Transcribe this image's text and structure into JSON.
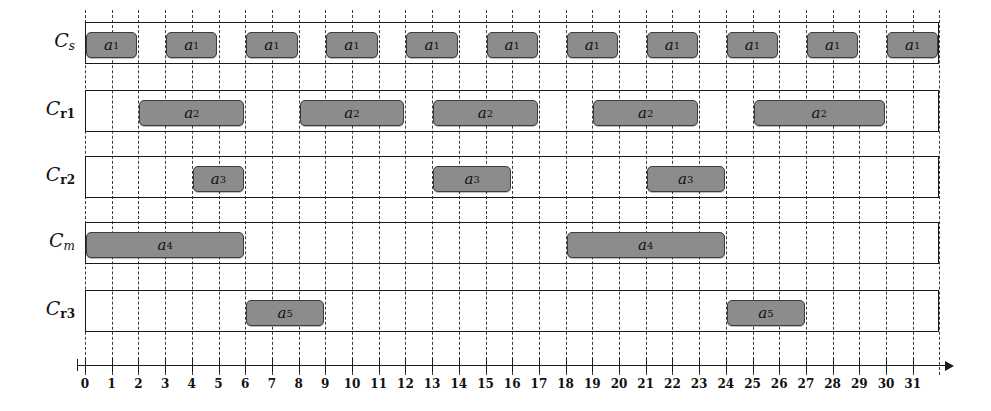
{
  "figure": {
    "kind": "gantt-schedule",
    "bar_fill": "#8c8c8c",
    "bar_stroke": "#3c3c3c",
    "line_color": "#1a1a1a",
    "grid_color": "#3a3a3a",
    "background": "#ffffff"
  },
  "axis": {
    "ticks": [
      "0",
      "1",
      "2",
      "3",
      "4",
      "5",
      "6",
      "7",
      "8",
      "9",
      "10",
      "11",
      "12",
      "13",
      "14",
      "15",
      "16",
      "17",
      "18",
      "19",
      "20",
      "21",
      "22",
      "23",
      "24",
      "25",
      "26",
      "27",
      "28",
      "29",
      "30",
      "31"
    ],
    "min": 0,
    "max": 32,
    "tick_step": 1,
    "label": ""
  },
  "rows": [
    {
      "id": "cs",
      "label_main": "C",
      "label_sub": "s",
      "label_sub_italic": true,
      "lane_start": 0,
      "lane_end": 32,
      "tasks": [
        {
          "name": "a",
          "sub": "1",
          "start": 0,
          "end": 2
        },
        {
          "name": "a",
          "sub": "1",
          "start": 3,
          "end": 5
        },
        {
          "name": "a",
          "sub": "1",
          "start": 6,
          "end": 8
        },
        {
          "name": "a",
          "sub": "1",
          "start": 9,
          "end": 11
        },
        {
          "name": "a",
          "sub": "1",
          "start": 12,
          "end": 14
        },
        {
          "name": "a",
          "sub": "1",
          "start": 15,
          "end": 17
        },
        {
          "name": "a",
          "sub": "1",
          "start": 18,
          "end": 20
        },
        {
          "name": "a",
          "sub": "1",
          "start": 21,
          "end": 23
        },
        {
          "name": "a",
          "sub": "1",
          "start": 24,
          "end": 26
        },
        {
          "name": "a",
          "sub": "1",
          "start": 27,
          "end": 29
        },
        {
          "name": "a",
          "sub": "1",
          "start": 30,
          "end": 32
        }
      ]
    },
    {
      "id": "cr1",
      "label_main": "C",
      "label_sub": "r1",
      "label_sub_italic": false,
      "lane_start": 0,
      "lane_end": 32,
      "tasks": [
        {
          "name": "a",
          "sub": "2",
          "start": 2,
          "end": 6
        },
        {
          "name": "a",
          "sub": "2",
          "start": 8,
          "end": 12
        },
        {
          "name": "a",
          "sub": "2",
          "start": 13,
          "end": 17
        },
        {
          "name": "a",
          "sub": "2",
          "start": 19,
          "end": 23
        },
        {
          "name": "a",
          "sub": "2",
          "start": 25,
          "end": 30
        }
      ]
    },
    {
      "id": "cr2",
      "label_main": "C",
      "label_sub": "r2",
      "label_sub_italic": false,
      "lane_start": 0,
      "lane_end": 32,
      "tasks": [
        {
          "name": "a",
          "sub": "3",
          "start": 4,
          "end": 6
        },
        {
          "name": "a",
          "sub": "3",
          "start": 13,
          "end": 16
        },
        {
          "name": "a",
          "sub": "3",
          "start": 21,
          "end": 24
        }
      ]
    },
    {
      "id": "cm",
      "label_main": "C",
      "label_sub": "m",
      "label_sub_italic": true,
      "lane_start": 0,
      "lane_end": 32,
      "tasks": [
        {
          "name": "a",
          "sub": "4",
          "start": 0,
          "end": 6
        },
        {
          "name": "a",
          "sub": "4",
          "start": 18,
          "end": 24
        }
      ]
    },
    {
      "id": "cr3",
      "label_main": "C",
      "label_sub": "r3",
      "label_sub_italic": false,
      "lane_start": 0,
      "lane_end": 32,
      "tasks": [
        {
          "name": "a",
          "sub": "5",
          "start": 6,
          "end": 9
        },
        {
          "name": "a",
          "sub": "5",
          "start": 24,
          "end": 27
        }
      ]
    }
  ],
  "chart_data": {
    "type": "bar",
    "title": "",
    "xlabel": "",
    "ylabel": "",
    "xlim": [
      0,
      32
    ],
    "grid": true,
    "legend": "none",
    "categories": [
      "C_s",
      "C_r1",
      "C_r2",
      "C_m",
      "C_r3"
    ],
    "series": [
      {
        "name": "a_1",
        "row": "C_s",
        "intervals": [
          [
            0,
            2
          ],
          [
            3,
            5
          ],
          [
            6,
            8
          ],
          [
            9,
            11
          ],
          [
            12,
            14
          ],
          [
            15,
            17
          ],
          [
            18,
            20
          ],
          [
            21,
            23
          ],
          [
            24,
            26
          ],
          [
            27,
            29
          ],
          [
            30,
            32
          ]
        ]
      },
      {
        "name": "a_2",
        "row": "C_r1",
        "intervals": [
          [
            2,
            6
          ],
          [
            8,
            12
          ],
          [
            13,
            17
          ],
          [
            19,
            23
          ],
          [
            25,
            30
          ]
        ]
      },
      {
        "name": "a_3",
        "row": "C_r2",
        "intervals": [
          [
            4,
            6
          ],
          [
            13,
            16
          ],
          [
            21,
            24
          ]
        ]
      },
      {
        "name": "a_4",
        "row": "C_m",
        "intervals": [
          [
            0,
            6
          ],
          [
            18,
            24
          ]
        ]
      },
      {
        "name": "a_5",
        "row": "C_r3",
        "intervals": [
          [
            6,
            9
          ],
          [
            24,
            27
          ]
        ]
      }
    ],
    "x_ticks": [
      0,
      1,
      2,
      3,
      4,
      5,
      6,
      7,
      8,
      9,
      10,
      11,
      12,
      13,
      14,
      15,
      16,
      17,
      18,
      19,
      20,
      21,
      22,
      23,
      24,
      25,
      26,
      27,
      28,
      29,
      30,
      31
    ]
  }
}
